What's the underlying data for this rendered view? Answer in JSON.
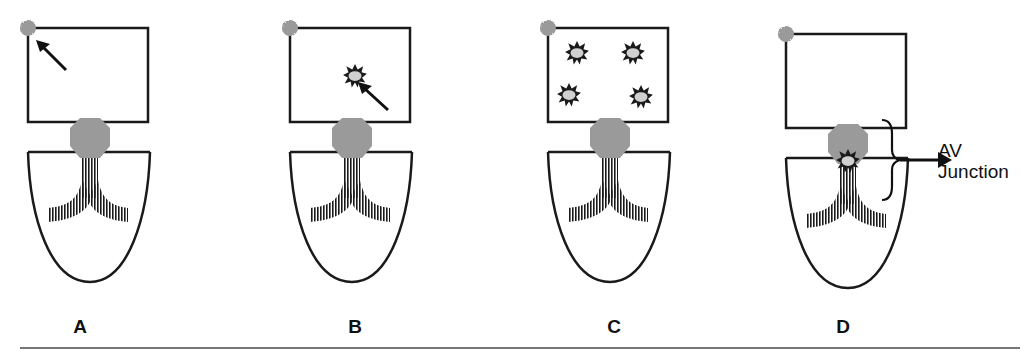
{
  "figure": {
    "panels": [
      {
        "id": "A",
        "label": "A",
        "description": "Sinus node impulse at top-left of atrium (arrow points to SA node)"
      },
      {
        "id": "B",
        "label": "B",
        "description": "Single ectopic atrial focus with arrow"
      },
      {
        "id": "C",
        "label": "C",
        "description": "Multiple ectopic atrial foci (four)"
      },
      {
        "id": "D",
        "label": "D",
        "description": "Ectopic focus at AV junction"
      }
    ],
    "annotation": {
      "line1": "AV",
      "line2": "Junction"
    },
    "colors": {
      "outline": "#1a1a1a",
      "node_fill": "#9a9a9a",
      "focus_fill": "#d0d0d0",
      "divider": "#777777"
    }
  }
}
